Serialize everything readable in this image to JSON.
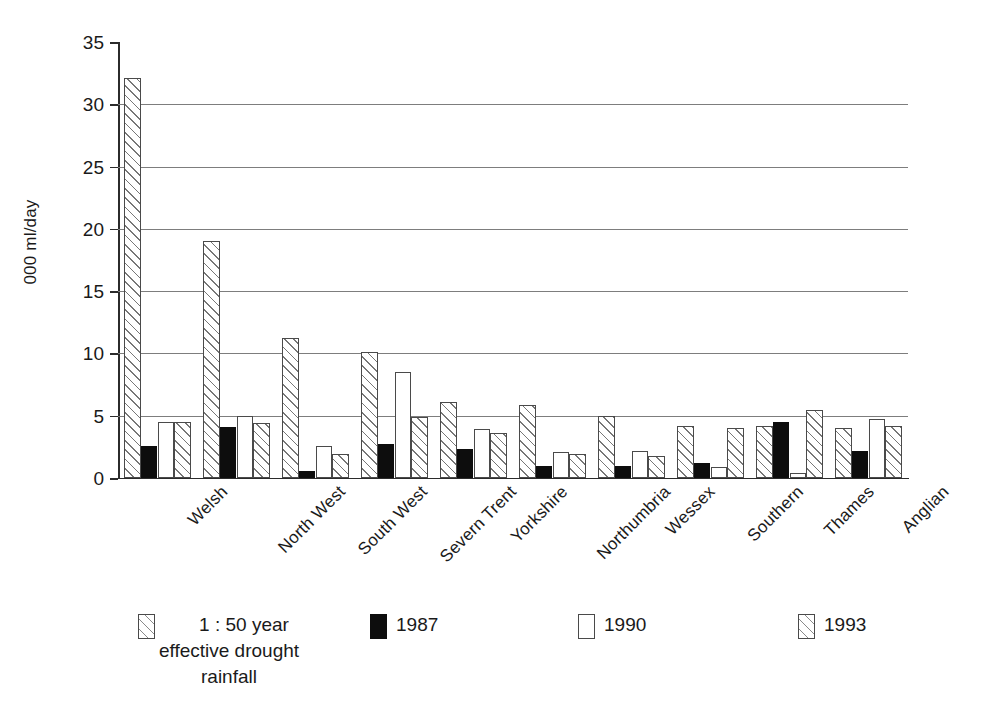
{
  "chart_data": {
    "type": "bar",
    "title": "",
    "xlabel": "",
    "ylabel": "000 ml/day",
    "ylim": [
      0,
      35
    ],
    "yticks": [
      0,
      5,
      10,
      15,
      20,
      25,
      30,
      35
    ],
    "grid": true,
    "legend_position": "bottom",
    "categories": [
      "Welsh",
      "North West",
      "South West",
      "Severn Trent",
      "Yorkshire",
      "Northumbria",
      "Wessex",
      "Southern",
      "Thames",
      "Anglian"
    ],
    "series": [
      {
        "name": "1 : 50  year\neffective drought\nrainfall",
        "pattern": "diagonal-hatch",
        "values": [
          32.1,
          19.0,
          11.2,
          10.1,
          6.1,
          5.9,
          5.0,
          4.2,
          4.2,
          4.0
        ]
      },
      {
        "name": "1987",
        "pattern": "solid-black",
        "values": [
          2.6,
          4.1,
          0.6,
          2.7,
          2.3,
          1.0,
          1.0,
          1.2,
          4.5,
          2.2
        ]
      },
      {
        "name": "1990",
        "pattern": "solid-white",
        "values": [
          4.5,
          5.0,
          2.6,
          8.5,
          3.9,
          2.1,
          2.2,
          0.9,
          0.4,
          4.7
        ]
      },
      {
        "name": "1993",
        "pattern": "diagonal-hatch",
        "values": [
          4.5,
          4.4,
          1.9,
          4.9,
          3.6,
          1.9,
          1.8,
          4.0,
          5.5,
          4.2
        ]
      }
    ]
  },
  "legend": {
    "entries": [
      {
        "label": "1 : 50  year\neffective drought\nrainfall",
        "swatch": "diagonal-hatch"
      },
      {
        "label": "1987",
        "swatch": "solid-black"
      },
      {
        "label": "1990",
        "swatch": "solid-white"
      },
      {
        "label": "1993",
        "swatch": "diagonal-hatch"
      }
    ]
  },
  "colors": {
    "axis": "#2b2b2b",
    "gridline": "#7d7d7d",
    "hatch": "#777777",
    "black_series": "#0d0d0d",
    "white_series": "#ffffff",
    "background": "#ffffff"
  }
}
